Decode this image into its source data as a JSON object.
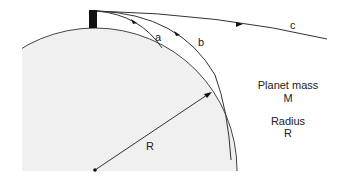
{
  "diagram": {
    "trajectory_labels": {
      "a": "a",
      "b": "b",
      "c": "c"
    },
    "radius_label": "R",
    "legend": {
      "mass_title": "Planet mass",
      "mass_symbol": "M",
      "radius_title": "Radius",
      "radius_symbol": "R"
    },
    "colors": {
      "planet_fill": "#f0f0f0",
      "line": "#333333",
      "tower": "#111111"
    }
  }
}
